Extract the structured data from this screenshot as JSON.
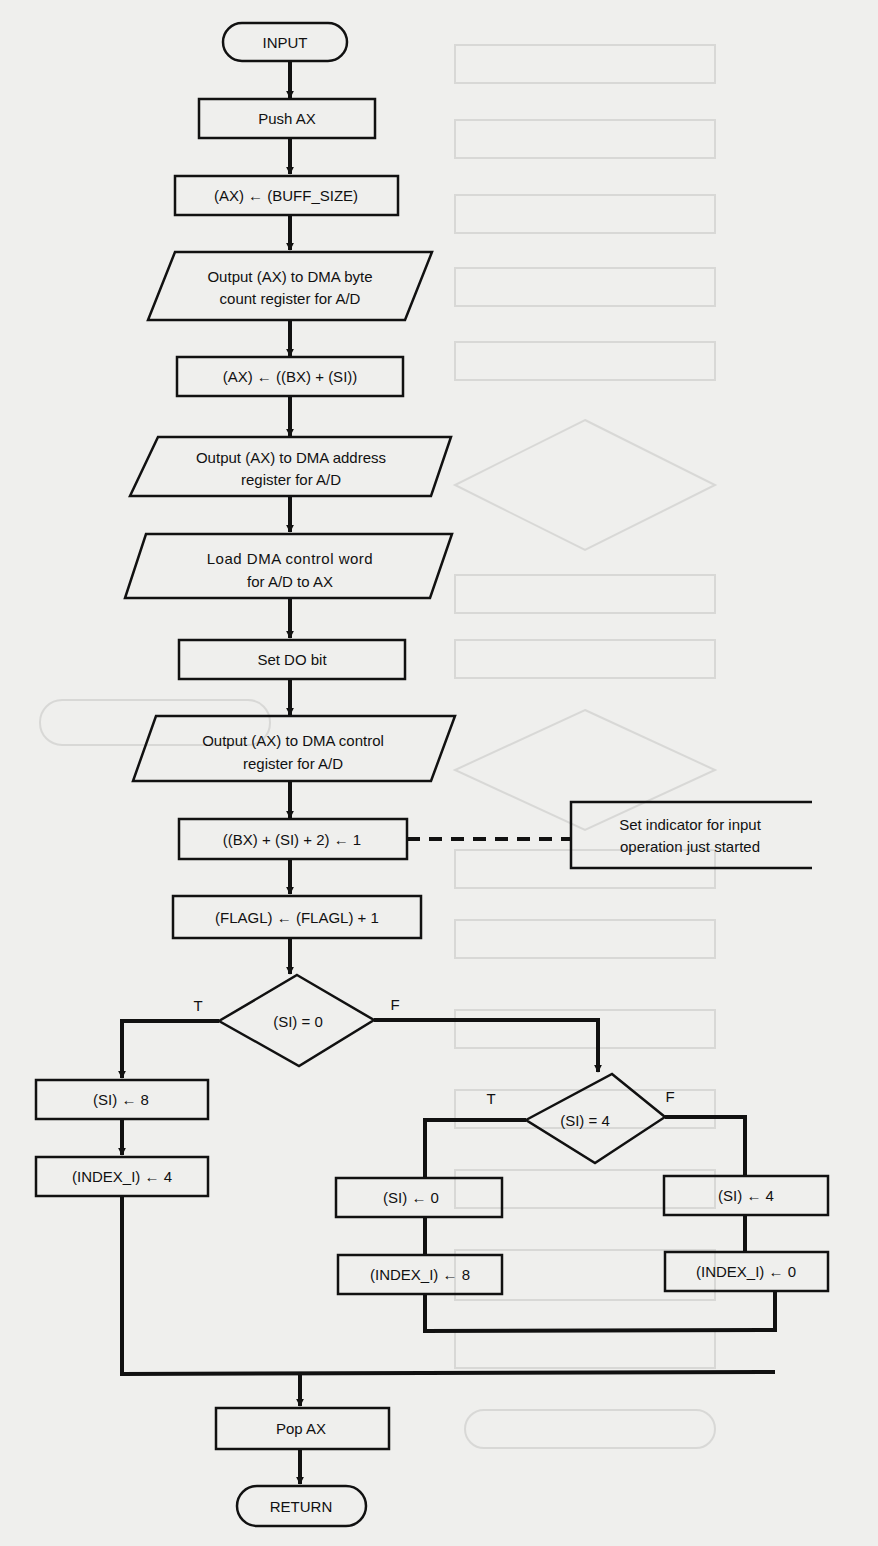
{
  "flowchart": {
    "start": "INPUT",
    "end": "RETURN",
    "steps": {
      "push_ax": "Push AX",
      "ax_buff": "(AX) ← (BUFF_SIZE)",
      "out_count_1": "Output (AX) to DMA byte",
      "out_count_2": "count register for A/D",
      "ax_bx_si": "(AX) ← ((BX) + (SI))",
      "out_addr_1": "Output (AX) to DMA address",
      "out_addr_2": "register for A/D",
      "load_ctrl_1": "Load DMA control word",
      "load_ctrl_2": "for A/D to AX",
      "set_do": "Set DO bit",
      "out_ctrl_1": "Output (AX) to DMA control",
      "out_ctrl_2": "register for A/D",
      "set_ind": "((BX) + (SI) + 2) ← 1",
      "flagl": "(FLAGL) ← (FLAGL) + 1",
      "si8": "(SI) ← 8",
      "idx4": "(INDEX_I) ← 4",
      "si0": "(SI) ← 0",
      "idx8": "(INDEX_I) ← 8",
      "si4": "(SI) ← 4",
      "idx0": "(INDEX_I) ← 0",
      "pop_ax": "Pop AX"
    },
    "decisions": {
      "d1": "(SI) = 0",
      "d2": "(SI) = 4"
    },
    "branch_labels": {
      "true": "T",
      "false": "F"
    },
    "annotation": {
      "line1": "Set indicator for input",
      "line2": "operation just started"
    }
  },
  "colors": {
    "ink": "#111111",
    "paper": "#efefed"
  }
}
